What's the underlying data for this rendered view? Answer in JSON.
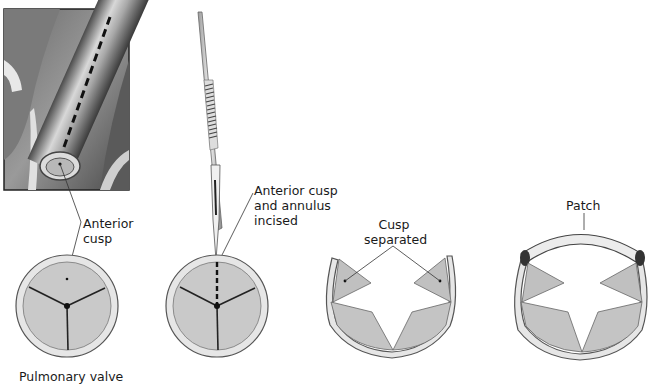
{
  "figure": {
    "panels": [
      {
        "id": "pulmonary-valve",
        "inset": "pulmonary-artery-illustration",
        "callout": [
          "Anterior",
          "cusp"
        ],
        "caption": "Pulmonary valve"
      },
      {
        "id": "incision",
        "callout": [
          "Anterior cusp",
          "and annulus",
          "incised"
        ]
      },
      {
        "id": "cusp-separated",
        "callout": [
          "Cusp",
          "separated"
        ]
      },
      {
        "id": "patch",
        "callout": [
          "Patch"
        ]
      }
    ]
  },
  "colors": {
    "cusp_fill": "#c9c9c9",
    "cusp_dark": "#b4b4b4",
    "rim_fill": "#e6e6e6",
    "outline": "#555555",
    "line": "#222222"
  }
}
